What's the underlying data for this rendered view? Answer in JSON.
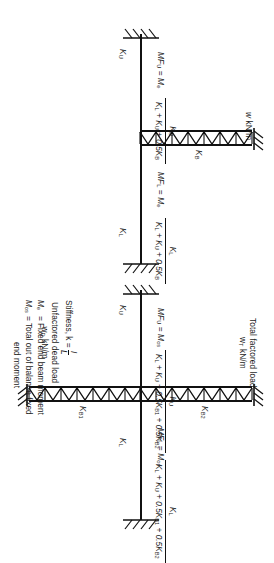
{
  "figure": {
    "ink_color": "#111111",
    "background": "#ffffff"
  },
  "diagram_left": {
    "name": "single-beam-subframe",
    "column_upper_label": "K",
    "column_upper_sub": "U",
    "column_lower_label": "K",
    "column_lower_sub": "L",
    "beam_label": "K",
    "beam_sub": "B",
    "load_text": "w kN/m",
    "moment_upper": "MF",
    "moment_upper_sub": "U",
    "moment_upper_eq": "= M",
    "moment_upper_eq_sub": "e",
    "moment_lower": "MF",
    "moment_lower_sub": "L",
    "moment_lower_eq": "= M",
    "moment_lower_eq_sub": "e",
    "fraction_upper_num": "K",
    "fraction_upper_num_sub": "U",
    "fraction_upper_den": "K",
    "fraction_upper_den_full": "K_L + K_U + 0.5K_B",
    "fraction_lower_num_sub": "L",
    "fraction_lower_den_full": "K_L + K_U + 0.5K_B"
  },
  "diagram_right": {
    "name": "two-beam-subframe",
    "column_upper_label": "K",
    "column_upper_sub": "U",
    "column_lower_label": "K",
    "column_lower_sub": "L",
    "beam_upper_label": "K",
    "beam_upper_sub": "B2",
    "beam_lower_label": "K",
    "beam_lower_sub": "B1",
    "load_top_line1": "Total factored load",
    "load_top_line2": "w",
    "load_top_line2_sub": "T",
    "load_top_line2_unit": " kN/m",
    "load_bottom_line1": "Unfactored dead load",
    "load_bottom_line2": "w",
    "load_bottom_line2_sub": "D",
    "load_bottom_line2_unit": " kN/m",
    "moment_upper": "MF",
    "moment_upper_sub": "U",
    "moment_upper_eq": "= M",
    "moment_upper_eq_sub": "os",
    "moment_lower": "MF",
    "moment_lower_sub": "L",
    "moment_lower_eq": "= M",
    "moment_lower_eq_sub": "os",
    "fraction_upper_num_sub": "U",
    "fraction_den_full": "K_L + K_U + 0.5K_B1 + 0.5K_B2",
    "fraction_lower_num_sub": "L"
  },
  "legend": {
    "stiffness_label": "Stiffness, k = ",
    "stiffness_num": "I",
    "stiffness_den": "L",
    "definitions": [
      {
        "symbol": "M",
        "symbol_sub": "e",
        "text": "= Fixed end beam moment"
      },
      {
        "symbol": "M",
        "symbol_sub": "os",
        "text": "= Total out of balance fixed",
        "text_line2": "end moment"
      }
    ]
  }
}
